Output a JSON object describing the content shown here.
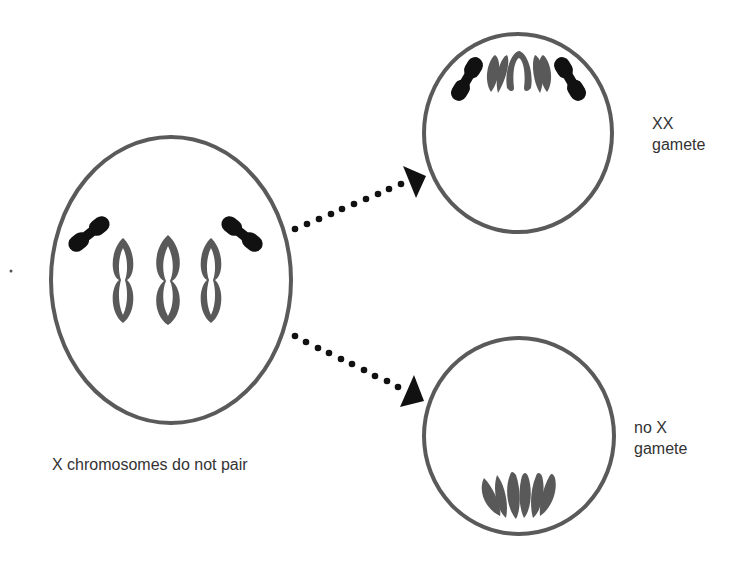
{
  "diagram": {
    "colors": {
      "cell_outline": "#5a5a5a",
      "autosome": "#595959",
      "x_chromosome": "#111111",
      "arrow": "#111111",
      "text": "#333333"
    },
    "parent_cell": {
      "caption": "X chromosomes do not pair",
      "x_chromosomes": 2,
      "autosome_pairs": 3
    },
    "arrows": [
      {
        "from": "parent_cell",
        "to": "xx_gamete",
        "style": "dotted"
      },
      {
        "from": "parent_cell",
        "to": "no_x_gamete",
        "style": "dotted"
      }
    ],
    "xx_gamete": {
      "label_line1": "XX",
      "label_line2": "gamete",
      "x_chromosomes": 2,
      "autosomes": 3
    },
    "no_x_gamete": {
      "label_line1": "no X",
      "label_line2": "gamete",
      "x_chromosomes": 0,
      "autosomes": 3
    }
  }
}
